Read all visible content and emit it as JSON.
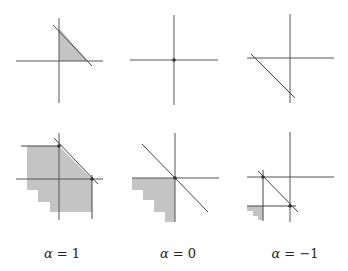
{
  "caption_fragment": "",
  "colors": {
    "axis": "#555555",
    "shade": "#c4c4c4",
    "line": "#444444",
    "background": "#ffffff"
  },
  "panels": [
    {
      "id": "top-alpha-1",
      "axes": {
        "vx": 59,
        "vy1": 18,
        "vy2": 103,
        "hy": 61,
        "hx1": 16,
        "hx2": 103
      },
      "lines": [
        {
          "x1": 53,
          "y1": 25,
          "x2": 92,
          "y2": 66
        }
      ],
      "shade": "59,28 59,61 88,61",
      "dots": []
    },
    {
      "id": "top-alpha-0",
      "axes": {
        "vx": 174,
        "vy1": 15,
        "vy2": 105,
        "hy": 60,
        "hx1": 130,
        "hx2": 218
      },
      "lines": [],
      "shade": "",
      "dots": [
        {
          "cx": 174,
          "cy": 60
        }
      ]
    },
    {
      "id": "top-alpha-neg1",
      "axes": {
        "vx": 290,
        "vy1": 14,
        "vy2": 103,
        "hy": 58,
        "hx1": 247,
        "hx2": 334
      },
      "lines": [
        {
          "x1": 251,
          "y1": 54,
          "x2": 295,
          "y2": 98
        }
      ],
      "shade": "",
      "dots": []
    },
    {
      "id": "bottom-alpha-1",
      "axes": {
        "vx": 59,
        "vy1": 133,
        "vy2": 220,
        "hy": 179,
        "hx1": 16,
        "hx2": 103
      },
      "lines": [
        {
          "x1": 54,
          "y1": 138,
          "x2": 98,
          "y2": 184
        },
        {
          "x1": 21,
          "y1": 146,
          "x2": 59,
          "y2": 146
        },
        {
          "x1": 92,
          "y1": 175,
          "x2": 92,
          "y2": 219
        }
      ],
      "shade": "27,146 59,146 92,179 92,212 50,212 50,202 38,202 38,190 27,190",
      "dots": [
        {
          "cx": 59,
          "cy": 146
        },
        {
          "cx": 92,
          "cy": 179
        }
      ]
    },
    {
      "id": "bottom-alpha-0",
      "axes": {
        "vx": 175,
        "vy1": 133,
        "vy2": 222,
        "hy": 178,
        "hx1": 132,
        "hx2": 219
      },
      "lines": [
        {
          "x1": 142,
          "y1": 144,
          "x2": 208,
          "y2": 212
        }
      ],
      "shade": "132,178 175,178 175,222 165,222 165,212 154,212 154,200 143,200 143,190 132,190",
      "dots": [
        {
          "cx": 175,
          "cy": 178
        }
      ]
    },
    {
      "id": "bottom-alpha-neg1",
      "axes": {
        "vx": 290,
        "vy1": 132,
        "vy2": 222,
        "hy": 177,
        "hx1": 247,
        "hx2": 334
      },
      "lines": [
        {
          "x1": 258,
          "y1": 171,
          "x2": 298,
          "y2": 212
        },
        {
          "x1": 263,
          "y1": 170,
          "x2": 263,
          "y2": 221
        },
        {
          "x1": 247,
          "y1": 206,
          "x2": 296,
          "y2": 206
        }
      ],
      "shade": "247,206 263,206 263,220 258,220 258,216 253,216 253,211 247,211",
      "dots": [
        {
          "cx": 263,
          "cy": 177
        },
        {
          "cx": 290,
          "cy": 206
        }
      ]
    }
  ],
  "labels": [
    {
      "x": 62,
      "symbol": "α",
      "text": " = 1"
    },
    {
      "x": 178,
      "symbol": "α",
      "text": " = 0"
    },
    {
      "x": 295,
      "symbol": "α",
      "text": " = −1"
    }
  ]
}
